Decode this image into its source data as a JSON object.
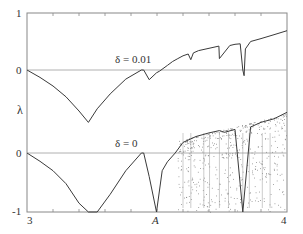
{
  "chart_data": {
    "type": "line",
    "title": "",
    "xlabel": "",
    "ylabel": "λ",
    "xlim": [
      3,
      4
    ],
    "ylim": [
      -1,
      1
    ],
    "x_tick_labels": [
      "3",
      "A",
      "4"
    ],
    "x_tick_positions": [
      3.0,
      3.5699,
      4.0
    ],
    "y_tick_labels": [
      "1",
      "0",
      "0",
      "-1"
    ],
    "minor_x_ticks": [
      3.1,
      3.2,
      3.3,
      3.4,
      3.5,
      3.6,
      3.7,
      3.8,
      3.9
    ],
    "grid": false,
    "legend": null,
    "panels": [
      {
        "name": "upper",
        "annotation": "δ = 0.01",
        "zero_line_label": "0",
        "description": "Lyapunov exponent with noise δ=0.01, offset upward; smooth curve with cusps, dips at periodic windows, rises to ~0.69 at x=4",
        "series": [
          {
            "name": "lambda_delta_0.01",
            "x": [
              3.0,
              3.05,
              3.1,
              3.15,
              3.2,
              3.236,
              3.27,
              3.32,
              3.38,
              3.44,
              3.449,
              3.47,
              3.498,
              3.51,
              3.54,
              3.56,
              3.58,
              3.6,
              3.62,
              3.63,
              3.64,
              3.66,
              3.7,
              3.738,
              3.74,
              3.78,
              3.8,
              3.82,
              3.83,
              3.835,
              3.84,
              3.86,
              3.9,
              3.95,
              4.0
            ],
            "y": [
              0.0,
              -0.13,
              -0.28,
              -0.47,
              -0.72,
              -0.92,
              -0.68,
              -0.42,
              -0.16,
              0.0,
              0.0,
              -0.17,
              -0.05,
              -0.02,
              0.08,
              0.15,
              0.2,
              0.25,
              0.28,
              0.18,
              0.3,
              0.34,
              0.38,
              0.42,
              0.2,
              0.43,
              0.45,
              0.46,
              0.0,
              -0.1,
              0.37,
              0.5,
              0.55,
              0.62,
              0.69
            ]
          }
        ]
      },
      {
        "name": "lower",
        "annotation": "δ = 0",
        "zero_line_label": "0",
        "bottom_label": "-1",
        "description": "Noise-free Lyapunov exponent of logistic map; superstable cusps to -∞ at 3.236 and 3.498, chaotic region beyond A with dense periodic windows",
        "series": [
          {
            "name": "lambda_delta_0",
            "x": [
              3.0,
              3.05,
              3.1,
              3.15,
              3.2,
              3.236,
              3.27,
              3.32,
              3.38,
              3.44,
              3.449,
              3.47,
              3.498,
              3.52,
              3.54,
              3.5699,
              3.6,
              3.65,
              3.7,
              3.74,
              3.76,
              3.8,
              3.83,
              3.86,
              3.9,
              3.95,
              4.0
            ],
            "y": [
              0.0,
              -0.14,
              -0.3,
              -0.52,
              -0.85,
              -1.0,
              -1.0,
              -0.7,
              -0.3,
              0.0,
              0.0,
              -0.4,
              -1.0,
              -0.3,
              -0.15,
              0.0,
              0.18,
              0.28,
              0.34,
              0.38,
              0.35,
              0.4,
              -1.0,
              0.44,
              0.52,
              0.58,
              0.69
            ]
          }
        ]
      }
    ]
  },
  "labels": {
    "y_top": "1",
    "y_zero_upper": "0",
    "y_axis_symbol": "λ",
    "y_zero_lower": "0",
    "y_bottom": "-1",
    "x_left": "3",
    "x_mid": "A",
    "x_right": "4",
    "ann_upper": "δ = 0.01",
    "ann_lower": "δ = 0"
  },
  "colors": {
    "curve": "#3a3a3a",
    "frame": "#888888",
    "zero_line": "#b0b0b0",
    "text": "#333333"
  }
}
